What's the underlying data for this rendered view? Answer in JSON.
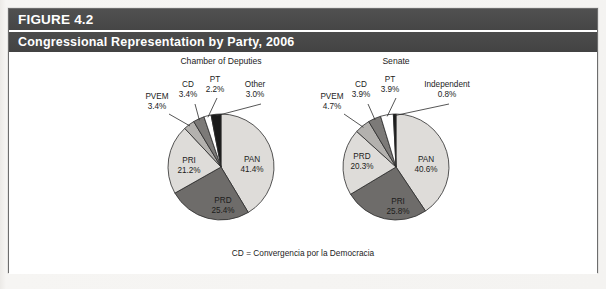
{
  "figure": {
    "number_label": "FIGURE 4.2",
    "title": "Congressional Representation by Party, 2006",
    "footnote": "CD = Convergencia por la Democracia"
  },
  "colors": {
    "header_bar": "#4a4a4a",
    "header_text": "#ffffff",
    "box_border": "#6d6d6d",
    "page_background": "#f4f3f1",
    "slice_light": "#dedcd9",
    "slice_mid": "#b3b1ae",
    "slice_dark": "#6e6c6a",
    "slice_white": "#ffffff",
    "slice_black": "#1a1a1a",
    "slice_outline": "#2b2b2b",
    "text": "#1c1c1c"
  },
  "chart_data": [
    {
      "type": "pie",
      "title": "Chamber of Deputies",
      "unit": "%",
      "start_angle_deg": 0,
      "direction": "clockwise",
      "categories": [
        "PAN",
        "PRD",
        "PRI",
        "PVEM",
        "CD",
        "PT",
        "Other"
      ],
      "values": [
        41.4,
        25.4,
        21.2,
        3.4,
        3.4,
        2.2,
        3.0
      ],
      "labels": [
        "41.4%",
        "25.4%",
        "21.2%",
        "3.4%",
        "3.4%",
        "2.2%",
        "3.0%"
      ],
      "slice_colors": [
        "#dedcd9",
        "#6e6c6a",
        "#dedcd9",
        "#b3b1ae",
        "#7c7a78",
        "#ffffff",
        "#1a1a1a"
      ],
      "label_placement": [
        "inside",
        "inside",
        "inside",
        "outside",
        "outside",
        "outside",
        "outside"
      ]
    },
    {
      "type": "pie",
      "title": "Senate",
      "unit": "%",
      "start_angle_deg": 0,
      "direction": "clockwise",
      "categories": [
        "PAN",
        "PRI",
        "PRD",
        "PVEM",
        "CD",
        "PT",
        "Independent"
      ],
      "values": [
        40.6,
        25.8,
        20.3,
        4.7,
        3.9,
        3.9,
        0.8
      ],
      "labels": [
        "40.6%",
        "25.8%",
        "20.3%",
        "4.7%",
        "3.9%",
        "3.9%",
        "0.8%"
      ],
      "slice_colors": [
        "#dedcd9",
        "#6e6c6a",
        "#dedcd9",
        "#b3b1ae",
        "#7c7a78",
        "#ffffff",
        "#1a1a1a"
      ],
      "label_placement": [
        "inside",
        "inside",
        "inside",
        "outside",
        "outside",
        "outside",
        "outside"
      ]
    }
  ],
  "charts_layout": [
    {
      "cx": 212,
      "cy": 115,
      "r": 53,
      "title_x": 212,
      "title_y": 3
    },
    {
      "cx": 387,
      "cy": 115,
      "r": 53,
      "title_x": 387,
      "title_y": 3
    }
  ],
  "annotations": {
    "deputies": {
      "pvem_label": "PVEM",
      "pvem_value": "3.4%",
      "cd_label": "CD",
      "cd_value": "3.4%",
      "pt_label": "PT",
      "pt_value": "2.2%",
      "other_label": "Other",
      "other_value": "3.0%",
      "pan_label": "PAN",
      "pan_value": "41.4%",
      "prd_label": "PRD",
      "prd_value": "25.4%",
      "pri_label": "PRI",
      "pri_value": "21.2%"
    },
    "senate": {
      "pvem_label": "PVEM",
      "pvem_value": "4.7%",
      "cd_label": "CD",
      "cd_value": "3.9%",
      "pt_label": "PT",
      "pt_value": "3.9%",
      "independent_label": "Independent",
      "independent_value": "0.8%",
      "pan_label": "PAN",
      "pan_value": "40.6%",
      "pri_label": "PRI",
      "pri_value": "25.8%",
      "prd_label": "PRD",
      "prd_value": "20.3%"
    }
  }
}
